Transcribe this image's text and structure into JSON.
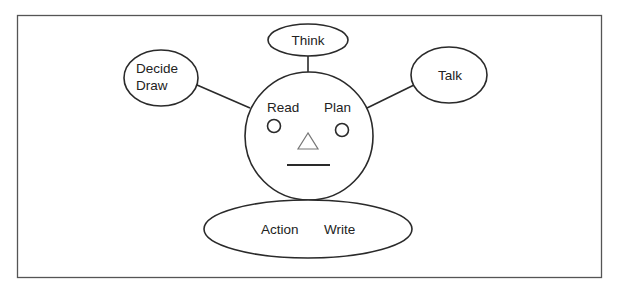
{
  "diagram": {
    "type": "concept-face-diagram",
    "center": {
      "shape": "circle",
      "labels": {
        "left_eye": "Read",
        "right_eye": "Plan"
      },
      "features": [
        "left-eye-circle",
        "right-eye-circle",
        "nose-triangle",
        "mouth-line"
      ]
    },
    "nodes": [
      {
        "id": "think",
        "label": "Think",
        "position": "top"
      },
      {
        "id": "decide-draw",
        "label_line1": "Decide",
        "label_line2": "Draw",
        "position": "left"
      },
      {
        "id": "talk",
        "label": "Talk",
        "position": "right"
      },
      {
        "id": "action-write",
        "label_left": "Action",
        "label_right": "Write",
        "position": "bottom"
      }
    ],
    "edges": [
      {
        "from": "think",
        "to": "center"
      },
      {
        "from": "decide-draw",
        "to": "center"
      },
      {
        "from": "talk",
        "to": "center"
      },
      {
        "from": "action-write",
        "to": "center"
      }
    ]
  },
  "colors": {
    "line": "#2a2a2a",
    "frame": "#555555",
    "background": "#ffffff",
    "nose": "#777777"
  }
}
